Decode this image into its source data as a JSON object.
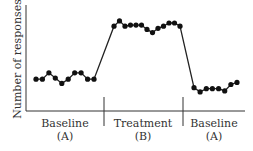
{
  "chart_data": {
    "type": "line",
    "title": "",
    "xlabel": "",
    "ylabel": "Number of responses",
    "grid": false,
    "legend": "none",
    "phases": [
      {
        "name": "Baseline",
        "code": "(A)"
      },
      {
        "name": "Treatment",
        "code": "(B)"
      },
      {
        "name": "Baseline",
        "code": "(A)"
      }
    ],
    "series": [
      {
        "name": "Baseline (A)",
        "phase": 0,
        "values": [
          3.0,
          3.0,
          3.6,
          3.1,
          2.6,
          3.0,
          3.6,
          3.6,
          3.0,
          3.0
        ]
      },
      {
        "name": "Treatment (B)",
        "phase": 1,
        "values": [
          8.0,
          8.5,
          8.0,
          8.1,
          8.1,
          8.1,
          7.7,
          7.4,
          7.8,
          8.0,
          8.3,
          8.3,
          8.0
        ]
      },
      {
        "name": "Baseline (A) return",
        "phase": 2,
        "values": [
          2.2,
          1.8,
          2.1,
          2.1,
          2.1,
          1.9,
          2.5,
          2.7
        ]
      }
    ],
    "y_range_note": "unlabeled axis; values are relative (0 = x-axis, 10 = top of y-axis)",
    "ylim": [
      0,
      10
    ]
  },
  "labels": {
    "ylabel": "Number of responses",
    "phase1_name": "Baseline",
    "phase1_code": "(A)",
    "phase2_name": "Treatment",
    "phase2_code": "(B)",
    "phase3_name": "Baseline",
    "phase3_code": "(A)"
  },
  "colors": {
    "line": "#222222",
    "marker": "#111111",
    "axis": "#333333",
    "text": "#333333"
  }
}
